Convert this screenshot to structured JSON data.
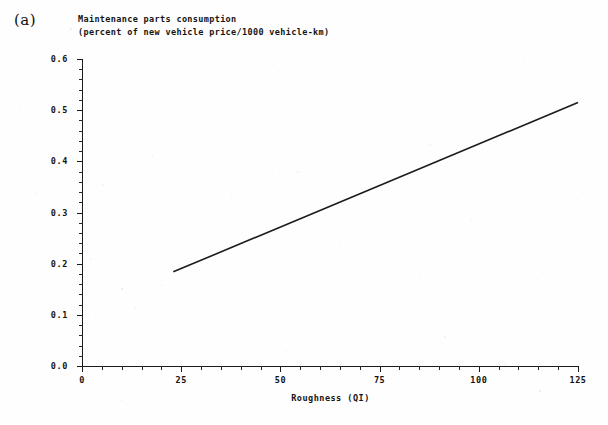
{
  "figure": {
    "panel_letter": "(a)",
    "title_lines": [
      "Maintenance parts consumption",
      "(percent of new vehicle price/1000 vehicle-km)"
    ],
    "background_color": "#fefefe",
    "line_color": "#1b1b1b"
  },
  "chart_data": {
    "type": "line",
    "title": "Maintenance parts consumption",
    "subtitle": "(percent of new vehicle price/1000 vehicle-km)",
    "panel": "(a)",
    "xlabel": "Roughness (QI)",
    "ylabel": "",
    "xlim": [
      0,
      125
    ],
    "ylim": [
      0.0,
      0.6
    ],
    "grid": false,
    "legend": "none",
    "x_ticks": [
      0,
      25,
      50,
      75,
      100,
      125
    ],
    "x_tick_labels": [
      "0",
      "25",
      "50",
      "75",
      "100",
      "125"
    ],
    "x_minor_tick_step": 5,
    "y_ticks": [
      0.0,
      0.1,
      0.2,
      0.3,
      0.4,
      0.5,
      0.6
    ],
    "y_tick_labels": [
      "0.0",
      "0.1",
      "0.2",
      "0.3",
      "0.4",
      "0.5",
      "0.6"
    ],
    "y_minor_tick_step": 0.02,
    "series": [
      {
        "name": "Maintenance parts consumption",
        "x": [
          23,
          125
        ],
        "values": [
          0.184,
          0.515
        ]
      }
    ]
  }
}
